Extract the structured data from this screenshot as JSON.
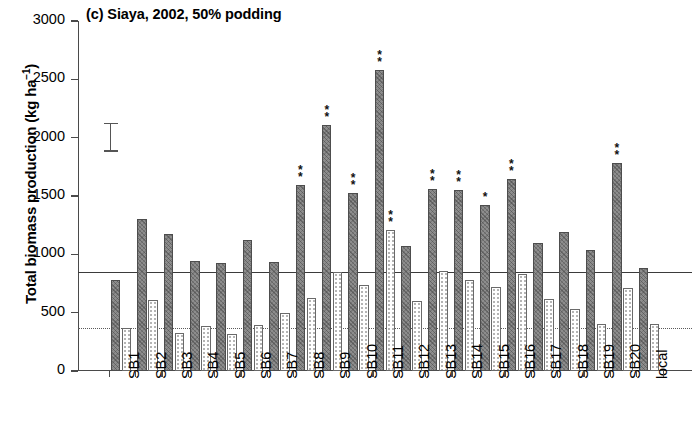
{
  "chart_data": {
    "type": "bar",
    "title": "(c) Siaya, 2002, 50% podding",
    "xlabel": "",
    "ylabel_plain": "Total biomass production (kg ha-1)",
    "ylabel_main": "Total biomass production (kg ha",
    "ylabel_sup": "−1",
    "ylabel_tail": ")",
    "ylim": [
      0,
      3000
    ],
    "yticks": [
      0,
      500,
      1000,
      1500,
      2000,
      2500,
      3000
    ],
    "ytick_labels": [
      "0",
      "500",
      "1000",
      "1500",
      "2000",
      "2500",
      "3000"
    ],
    "grid": false,
    "legend_position": "none",
    "categories": [
      "SB1",
      "SB2",
      "SB3",
      "SB4",
      "SB5",
      "SB6",
      "SB7",
      "SB8",
      "SB9",
      "SB10",
      "SB11",
      "SB12",
      "SB13",
      "SB14",
      "SB15",
      "SB16",
      "SB17",
      "SB18",
      "SB19",
      "SB20",
      "local"
    ],
    "series": [
      {
        "name": "dark-hatched-bar",
        "values": [
          780,
          1300,
          1175,
          945,
          925,
          1120,
          935,
          1595,
          2110,
          1530,
          2580,
          1070,
          1560,
          1550,
          1425,
          1645,
          1095,
          1190,
          1035,
          1780,
          880
        ]
      },
      {
        "name": "light-dotted-bar",
        "values": [
          370,
          610,
          330,
          390,
          320,
          395,
          500,
          630,
          850,
          740,
          1205,
          600,
          855,
          780,
          720,
          830,
          620,
          535,
          400,
          710,
          400
        ]
      }
    ],
    "significance_markers": {
      "SB8": {
        "series": "dark-hatched-bar",
        "marks": "**"
      },
      "SB9": {
        "series": "dark-hatched-bar",
        "marks": "**"
      },
      "SB10": {
        "series": "dark-hatched-bar",
        "marks": "**"
      },
      "SB11": {
        "series": "dark-hatched-bar",
        "marks": "**",
        "light_marks": "**"
      },
      "SB13": {
        "series": "dark-hatched-bar",
        "marks": "**"
      },
      "SB14": {
        "series": "dark-hatched-bar",
        "marks": "**"
      },
      "SB15": {
        "series": "dark-hatched-bar",
        "marks": "*"
      },
      "SB16": {
        "series": "dark-hatched-bar",
        "marks": "**"
      },
      "SB20": {
        "series": "dark-hatched-bar",
        "marks": "**"
      }
    },
    "reference_lines": [
      {
        "name": "control-mean-solid",
        "value": 850,
        "style": "solid"
      },
      {
        "name": "control-mean-dotted",
        "value": 370,
        "style": "dotted"
      }
    ],
    "error_bar_lsd": {
      "name": "lsd-bar",
      "low": 1880,
      "high": 2130,
      "center": 2005
    },
    "colors": {
      "dark_bar": "#8d8d8d",
      "light_bar": "#ffffff",
      "axis": "#4a4a4a",
      "reference_line": "#3b3b3b"
    }
  }
}
